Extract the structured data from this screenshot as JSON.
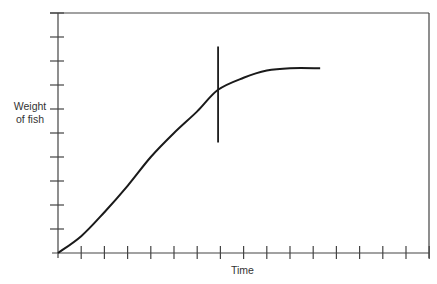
{
  "chart_data": {
    "type": "line",
    "title": "",
    "xlabel": "Time",
    "ylabel": "Weight of fish",
    "ylabel_lines": [
      "Weight",
      "of fish"
    ],
    "x_ticks_count": 16,
    "y_ticks_count": 10,
    "tick_labels": "none",
    "grid": false,
    "xlim": [
      0,
      16
    ],
    "ylim": [
      0,
      10
    ],
    "series": [
      {
        "name": "growth curve (sigmoid)",
        "x": [
          0,
          1,
          2,
          3,
          4,
          5,
          6,
          6.9,
          8,
          9,
          10,
          11.3
        ],
        "y": [
          0,
          0.7,
          1.7,
          2.8,
          4.0,
          5.0,
          5.9,
          6.8,
          7.3,
          7.6,
          7.7,
          7.7
        ]
      }
    ],
    "annotations": [
      {
        "type": "vertical-marker",
        "x": 6.9,
        "y_from": 4.6,
        "y_to": 8.6,
        "description": "vertical line crossing curve at inflection toward plateau"
      }
    ],
    "colors": {
      "line": "#1a1a1a",
      "axis": "#333333"
    }
  }
}
